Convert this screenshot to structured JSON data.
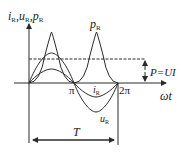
{
  "diagram": {
    "y_axis_label": {
      "parts": [
        {
          "var": "i",
          "sub": "R"
        },
        {
          "sep": ","
        },
        {
          "var": "u",
          "sub": "R"
        },
        {
          "sep": ","
        },
        {
          "var": "p",
          "sub": "R"
        }
      ]
    },
    "x_axis_label": "ωt",
    "ticks": {
      "pi": "π",
      "two_pi": "2π"
    },
    "curves": {
      "p_R": {
        "var": "p",
        "sub": "R",
        "description": "instantaneous power, always ≥ 0, two humps per period"
      },
      "u_R": {
        "var": "u",
        "sub": "R",
        "description": "voltage sine wave, larger amplitude"
      },
      "i_R": {
        "var": "i",
        "sub": "R",
        "description": "current sine wave, smaller amplitude, in phase with u_R"
      }
    },
    "average_power": {
      "label": "P=UI",
      "style": "dashed"
    },
    "period": {
      "label": "T"
    },
    "colors": {
      "stroke": "#2a2a2a",
      "background": "#ffffff"
    }
  }
}
